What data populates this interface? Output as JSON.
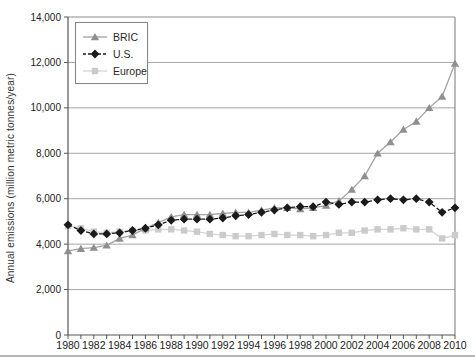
{
  "page": {
    "background": "#ffffff",
    "divider_color": "#b6b6b6"
  },
  "chart_data": {
    "type": "line",
    "title": "",
    "xlabel": "",
    "ylabel": "Annual emissions (million metric tonnes/year)",
    "ylim": [
      0,
      14000
    ],
    "ytick_step": 2000,
    "ytick_labels": [
      "0",
      "2,000",
      "4,000",
      "6,000",
      "8,000",
      "10,000",
      "12,000",
      "14,000"
    ],
    "x": [
      1980,
      1981,
      1982,
      1983,
      1984,
      1985,
      1986,
      1987,
      1988,
      1989,
      1990,
      1991,
      1992,
      1993,
      1994,
      1995,
      1996,
      1997,
      1998,
      1999,
      2000,
      2001,
      2002,
      2003,
      2004,
      2005,
      2006,
      2007,
      2008,
      2009,
      2010
    ],
    "xtick_labels": [
      "1980",
      "1982",
      "1984",
      "1986",
      "1988",
      "1990",
      "1992",
      "1994",
      "1996",
      "1998",
      "2000",
      "2002",
      "2004",
      "2006",
      "2008",
      "2010"
    ],
    "grid": "horizontal",
    "legend_position": "top-left",
    "colors": {
      "axis": "#555555",
      "grid": "#a6a6a6",
      "plot_border": "#8c8c8c",
      "tick_text": "#222222"
    },
    "series": [
      {
        "name": "BRIC",
        "marker": "triangle",
        "color": "#8f8f8f",
        "line_color": "#a3a3a3",
        "line_style": "solid",
        "values": [
          3700,
          3800,
          3850,
          3950,
          4250,
          4400,
          4700,
          4950,
          5200,
          5300,
          5300,
          5300,
          5350,
          5400,
          5400,
          5500,
          5600,
          5600,
          5550,
          5600,
          5700,
          5900,
          6400,
          7000,
          8000,
          8500,
          9050,
          9400,
          10000,
          10500,
          11950
        ]
      },
      {
        "name": "U.S.",
        "marker": "diamond",
        "color": "#1a1a1a",
        "line_color": "#1a1a1a",
        "line_style": "dashed",
        "values": [
          4850,
          4600,
          4450,
          4450,
          4500,
          4600,
          4700,
          4850,
          5050,
          5100,
          5100,
          5100,
          5150,
          5250,
          5300,
          5400,
          5500,
          5600,
          5650,
          5650,
          5850,
          5750,
          5850,
          5850,
          5950,
          6000,
          5950,
          6000,
          5850,
          5400,
          5600
        ]
      },
      {
        "name": "Europe",
        "marker": "square",
        "color": "#cbcbcb",
        "line_color": "#d4d4d4",
        "line_style": "solid",
        "values": [
          4800,
          4700,
          4550,
          4500,
          4550,
          4600,
          4600,
          4650,
          4650,
          4600,
          4550,
          4450,
          4400,
          4350,
          4350,
          4400,
          4450,
          4400,
          4400,
          4350,
          4400,
          4500,
          4500,
          4600,
          4650,
          4650,
          4700,
          4650,
          4650,
          4250,
          4400
        ]
      }
    ]
  }
}
